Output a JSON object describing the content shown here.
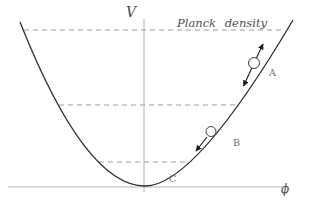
{
  "figure": {
    "labels": {
      "v_axis": "V",
      "phi_axis": "ϕ",
      "planck_density": "Planck density",
      "point_a": "A",
      "point_b": "B",
      "point_c": "C"
    },
    "colors": {
      "background": "#ffffff",
      "curve": "#2e2e2e",
      "axis": "#b3b3b3",
      "dashed_level": "#9a9a9a",
      "arrow": "#1a1a1a",
      "ball_fill": "#ffffff",
      "ball_stroke": "#3a3a3a",
      "math_text": "#4a4a4a",
      "point_text": "#6e6e6e"
    }
  }
}
